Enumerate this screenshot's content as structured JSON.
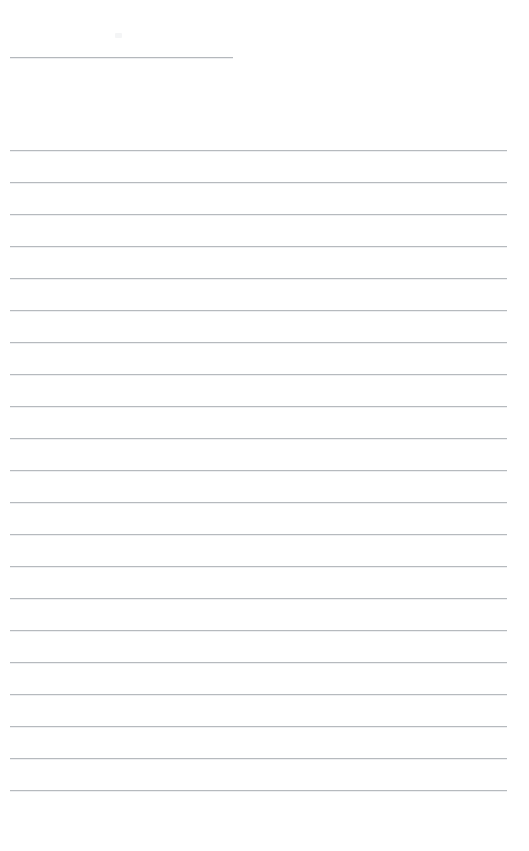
{
  "page": {
    "name": "lined-note-page",
    "width": 529,
    "height": 851,
    "background_color": "#ffffff",
    "title_text": "",
    "title_placeholder": ""
  },
  "title_rule": {
    "name": "title-rule",
    "x": 10,
    "y": 57,
    "width": 223,
    "color": "#b4b8bc"
  },
  "artifact": {
    "name": "artifact-mark",
    "x": 115,
    "y": 33,
    "color": "#f4f5f6"
  },
  "rules": {
    "color": "#b6babe",
    "shadow_color": "#eeeff1",
    "left": 10,
    "width": 497,
    "spacing": 32,
    "first_y": 150,
    "count": 21,
    "y_positions": [
      150,
      182,
      214,
      246,
      278,
      310,
      342,
      374,
      406,
      438,
      470,
      502,
      534,
      566,
      598,
      630,
      662,
      694,
      726,
      758,
      790
    ],
    "line_values": [
      "",
      "",
      "",
      "",
      "",
      "",
      "",
      "",
      "",
      "",
      "",
      "",
      "",
      "",
      "",
      "",
      "",
      "",
      "",
      "",
      ""
    ],
    "line_placeholder": ""
  }
}
